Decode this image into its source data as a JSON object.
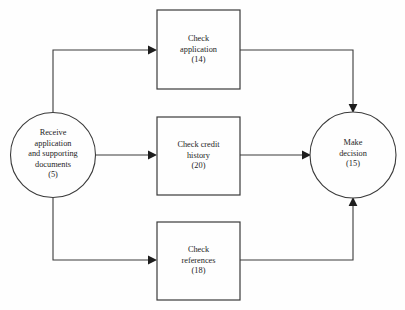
{
  "diagram": {
    "background_color": "#fefefe",
    "stroke_color": "#3a3a3a",
    "text_color": "#1d1d1d",
    "nodes": {
      "start": {
        "shape": "circle",
        "name": "receive-application",
        "text": "Receive\napplication\nand supporting\ndocuments\n(5)",
        "duration": "(5)",
        "cx": 53,
        "cy": 155,
        "r": 42.5
      },
      "check_application": {
        "shape": "rectangle",
        "name": "check-application",
        "text": "Check\napplication\n(14)",
        "duration": "(14)",
        "x": 157,
        "y": 10,
        "width": 83,
        "height": 79
      },
      "check_credit": {
        "shape": "rectangle",
        "name": "check-credit-history",
        "text": "Check credit\nhistory\n(20)",
        "duration": "(20)",
        "x": 157,
        "y": 117,
        "width": 83,
        "height": 78
      },
      "check_references": {
        "shape": "rectangle",
        "name": "check-references",
        "text": "Check\nreferences\n(18)",
        "duration": "(18)",
        "x": 157,
        "y": 222,
        "width": 83,
        "height": 78
      },
      "end": {
        "shape": "circle",
        "name": "make-decision",
        "text": "Make\ndecision\n(15)",
        "duration": "(15)",
        "cx": 353,
        "cy": 155,
        "r": 43
      }
    },
    "edges": [
      {
        "name": "edge-start-to-check-application",
        "from": "start",
        "to": "check_application",
        "path": "M 53 112.5 L 53 50 L 151 50",
        "arrow_at": {
          "x": 157,
          "y": 50,
          "dir": "right"
        }
      },
      {
        "name": "edge-start-to-check-credit",
        "from": "start",
        "to": "check_credit",
        "path": "M 95.5 155 L 151 155",
        "arrow_at": {
          "x": 157,
          "y": 155,
          "dir": "right"
        }
      },
      {
        "name": "edge-start-to-check-references",
        "from": "start",
        "to": "check_references",
        "path": "M 53 197.5 L 53 260 L 151 260",
        "arrow_at": {
          "x": 157,
          "y": 260,
          "dir": "right"
        }
      },
      {
        "name": "edge-check-application-to-end",
        "from": "check_application",
        "to": "end",
        "path": "M 240 50 L 353 50 L 353 106",
        "arrow_at": {
          "x": 353,
          "y": 112,
          "dir": "down"
        }
      },
      {
        "name": "edge-check-credit-to-end",
        "from": "check_credit",
        "to": "end",
        "path": "M 240 155 L 304 155",
        "arrow_at": {
          "x": 310,
          "y": 155,
          "dir": "right"
        }
      },
      {
        "name": "edge-check-references-to-end",
        "from": "check_references",
        "to": "end",
        "path": "M 240 260 L 353 260 L 353 204",
        "arrow_at": {
          "x": 353,
          "y": 198,
          "dir": "up"
        }
      }
    ]
  }
}
